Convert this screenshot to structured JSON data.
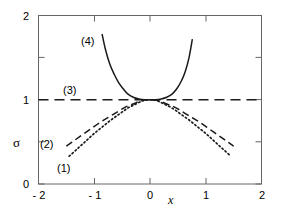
{
  "chart_data": {
    "type": "line",
    "title": "",
    "xlabel": "x",
    "ylabel": "σ",
    "xlim": [
      -2,
      2
    ],
    "ylim": [
      0,
      2
    ],
    "xticks": [
      -2,
      -1,
      0,
      1,
      2
    ],
    "xtick_labels": [
      "- 2",
      "- 1",
      "0",
      "1",
      "2"
    ],
    "yticks": [
      0,
      1,
      2
    ],
    "ytick_labels": [
      "0",
      "1",
      "2"
    ],
    "yminor_ticks": [
      0.5,
      1.5
    ],
    "grid": false,
    "legend": "inline-annotations",
    "series": [
      {
        "name": "(1)",
        "style": "dotted",
        "label": "(1)",
        "label_x": -1.22,
        "label_y": 0.35,
        "points": [
          [
            -1.45,
            0.33
          ],
          [
            -1.3,
            0.42
          ],
          [
            -1.15,
            0.51
          ],
          [
            -1.0,
            0.6
          ],
          [
            -0.85,
            0.68
          ],
          [
            -0.7,
            0.76
          ],
          [
            -0.55,
            0.83
          ],
          [
            -0.4,
            0.9
          ],
          [
            -0.25,
            0.95
          ],
          [
            -0.12,
            0.99
          ],
          [
            0.0,
            1.0
          ],
          [
            0.12,
            0.99
          ],
          [
            0.25,
            0.95
          ],
          [
            0.4,
            0.9
          ],
          [
            0.55,
            0.83
          ],
          [
            0.7,
            0.76
          ],
          [
            0.85,
            0.68
          ],
          [
            1.0,
            0.6
          ],
          [
            1.15,
            0.51
          ],
          [
            1.3,
            0.42
          ],
          [
            1.45,
            0.33
          ]
        ]
      },
      {
        "name": "(2)",
        "style": "dashed",
        "label": "(2)",
        "label_x": -1.45,
        "label_y": 0.58,
        "points": [
          [
            -1.5,
            0.45
          ],
          [
            -1.35,
            0.52
          ],
          [
            -1.2,
            0.59
          ],
          [
            -1.05,
            0.66
          ],
          [
            -0.9,
            0.73
          ],
          [
            -0.75,
            0.79
          ],
          [
            -0.6,
            0.85
          ],
          [
            -0.45,
            0.91
          ],
          [
            -0.3,
            0.95
          ],
          [
            -0.15,
            0.99
          ],
          [
            0.0,
            1.0
          ],
          [
            0.15,
            0.99
          ],
          [
            0.3,
            0.95
          ],
          [
            0.45,
            0.91
          ],
          [
            0.6,
            0.85
          ],
          [
            0.75,
            0.79
          ],
          [
            0.9,
            0.73
          ],
          [
            1.05,
            0.66
          ],
          [
            1.2,
            0.59
          ],
          [
            1.35,
            0.52
          ],
          [
            1.5,
            0.45
          ]
        ]
      },
      {
        "name": "(3)",
        "style": "long-dashed",
        "label": "(3)",
        "label_x": -1.25,
        "label_y": 1.12,
        "points": [
          [
            -2.0,
            1.0
          ],
          [
            2.0,
            1.0
          ]
        ]
      },
      {
        "name": "(4)",
        "style": "solid",
        "label": "(4)",
        "label_x": -1.0,
        "label_y": 1.7,
        "points": [
          [
            -0.86,
            1.78
          ],
          [
            -0.8,
            1.6
          ],
          [
            -0.72,
            1.42
          ],
          [
            -0.64,
            1.3
          ],
          [
            -0.56,
            1.2
          ],
          [
            -0.48,
            1.13
          ],
          [
            -0.4,
            1.07
          ],
          [
            -0.3,
            1.03
          ],
          [
            -0.2,
            1.01
          ],
          [
            -0.1,
            1.0
          ],
          [
            0.0,
            1.0
          ],
          [
            0.1,
            1.0
          ],
          [
            0.2,
            1.01
          ],
          [
            0.3,
            1.03
          ],
          [
            0.4,
            1.07
          ],
          [
            0.48,
            1.13
          ],
          [
            0.56,
            1.22
          ],
          [
            0.63,
            1.33
          ],
          [
            0.7,
            1.5
          ],
          [
            0.76,
            1.72
          ]
        ]
      }
    ]
  },
  "axes": {
    "xlabel": "x",
    "ylabel": "σ",
    "xtick_labels": [
      "- 2",
      "- 1",
      "0",
      "1",
      "2"
    ],
    "ytick_labels": [
      "0",
      "1",
      "2"
    ]
  },
  "annotations": {
    "c1": "(1)",
    "c2": "(2)",
    "c3": "(3)",
    "c4": "(4)"
  },
  "colors": {
    "line": "#1a1a1a",
    "frame": "#555555",
    "background": "#ffffff"
  }
}
